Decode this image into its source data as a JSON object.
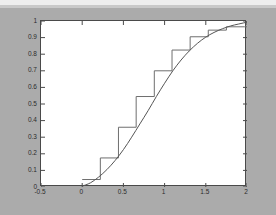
{
  "figure": {
    "background_color": "#ababab",
    "plot_background_color": "#ffffff",
    "axis_color": "#4a4a4a",
    "curve_color": "#555555",
    "step_color": "#6e6e6e"
  },
  "axis": {
    "x_tick_labels": [
      "-0.5",
      "0",
      "0.5",
      "1",
      "1.5",
      "2"
    ],
    "y_tick_labels": [
      "0",
      "0.1",
      "0.2",
      "0.3",
      "0.4",
      "0.5",
      "0.6",
      "0.7",
      "0.8",
      "0.9",
      "1"
    ]
  },
  "chart_data": {
    "type": "line",
    "title": "",
    "xlabel": "",
    "ylabel": "",
    "xlim": [
      -0.5,
      2
    ],
    "ylim": [
      0,
      1
    ],
    "grid": false,
    "legend": "none",
    "x_ticks": [
      -0.5,
      0,
      0.5,
      1,
      1.5,
      2
    ],
    "y_ticks": [
      0,
      0.1,
      0.2,
      0.3,
      0.4,
      0.5,
      0.6,
      0.7,
      0.8,
      0.9,
      1
    ],
    "series": [
      {
        "name": "theoretical-cdf",
        "style": "smooth-line",
        "color": "#555555",
        "x": [
          0.0,
          0.1,
          0.2,
          0.3,
          0.4,
          0.5,
          0.6,
          0.7,
          0.8,
          0.9,
          1.0,
          1.1,
          1.2,
          1.3,
          1.4,
          1.5,
          1.6,
          1.7,
          1.8,
          1.9,
          2.0
        ],
        "y": [
          0.005,
          0.025,
          0.06,
          0.105,
          0.16,
          0.225,
          0.3,
          0.38,
          0.46,
          0.545,
          0.625,
          0.7,
          0.765,
          0.82,
          0.866,
          0.903,
          0.931,
          0.953,
          0.97,
          0.982,
          0.993
        ]
      },
      {
        "name": "empirical-step-cdf",
        "style": "step-post",
        "color": "#6e6e6e",
        "x": [
          0.0,
          0.22,
          0.44,
          0.655,
          0.875,
          1.09,
          1.31,
          1.53,
          1.75,
          1.97
        ],
        "y": [
          0.045,
          0.175,
          0.36,
          0.545,
          0.7,
          0.825,
          0.905,
          0.945,
          0.965,
          0.965
        ]
      }
    ]
  }
}
